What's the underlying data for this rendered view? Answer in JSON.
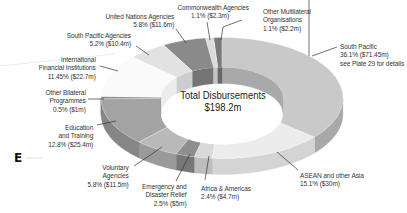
{
  "chart_data": {
    "type": "pie",
    "variant": "3d-donut",
    "title": "Total Disbursements",
    "total": "$198.2m",
    "total_value_m": 198.2,
    "start_angle_deg": 0,
    "direction": "clockwise",
    "slices": [
      {
        "name": "South Pacific",
        "pct": 36.1,
        "value_m": 71.45,
        "value_label": "$71.45m",
        "note": "see Plate 29 for details",
        "color": "#c9c9c9",
        "side": "#a9a9a9",
        "explode": 0
      },
      {
        "name": "ASEAN and other Asia",
        "pct": 15.1,
        "value_m": 30,
        "value_label": "$30m",
        "color": "#ececec",
        "side": "#d4d4d4",
        "explode": 0
      },
      {
        "name": "Africa & Americas",
        "pct": 2.4,
        "value_m": 4.7,
        "value_label": "$4.7m",
        "color": "#d9d9d9",
        "side": "#bdbdbd",
        "explode": 0
      },
      {
        "name": "Emergency and Disaster Relief",
        "pct": 2.5,
        "value_m": 5,
        "value_label": "$5m",
        "color": "#8f8f8f",
        "side": "#777777",
        "explode": 0
      },
      {
        "name": "Voluntary Agencies",
        "pct": 5.8,
        "value_m": 11.5,
        "value_label": "$11.5m",
        "color": "#b9b9b9",
        "side": "#9a9a9a",
        "explode": 0
      },
      {
        "name": "Education and Training",
        "pct": 12.8,
        "value_m": 25.4,
        "value_label": "$25.4m",
        "color": "#a3a3a3",
        "side": "#868686",
        "explode": 0
      },
      {
        "name": "Other Bilateral Programmes",
        "pct": 0.5,
        "value_m": 1,
        "value_label": "$1m",
        "color": "#7d7d7d",
        "side": "#666666",
        "explode": 0
      },
      {
        "name": "International Financial Institutions",
        "pct": 11.45,
        "value_m": 22.7,
        "value_label": "$22.7m",
        "color": "#fafafa",
        "side": "#ececec",
        "explode": 0
      },
      {
        "name": "South Pacific Agencies",
        "pct": 5.2,
        "value_m": 10.4,
        "value_label": "$10.4m",
        "color": "#e2e2e2",
        "side": "#cdcdcd",
        "explode": 0
      },
      {
        "name": "United Nations Agencies",
        "pct": 5.8,
        "value_m": 11.6,
        "value_label": "$11.6m",
        "color": "#8a8a8a",
        "side": "#747474",
        "explode": 0
      },
      {
        "name": "Commonwealth Agencies",
        "pct": 1.1,
        "value_m": 2.3,
        "value_label": "$2.3m",
        "color": "#dcdcdc",
        "side": "#c4c4c4",
        "explode": 0
      },
      {
        "name": "Other Multilateral Organisations",
        "pct": 1.1,
        "value_m": 2.2,
        "value_label": "$2.2m",
        "color": "#7a7a7a",
        "side": "#666666",
        "explode": 0
      }
    ],
    "legend": "none (direct labels with leader lines)"
  },
  "center": {
    "line1": "Total Disbursements",
    "line2": "$198.2m"
  },
  "marker": "E",
  "labels": {
    "south_pacific": [
      "South Pacific",
      "36.1% ($71.45m)",
      "see Plate 29 for details"
    ],
    "asean": [
      "ASEAN and other Asia",
      "15.1% ($30m)"
    ],
    "africa": [
      "Africa & Americas",
      "2.4% ($4.7m)"
    ],
    "emergency": [
      "Emergency and",
      "Disaster Relief",
      "2.5% ($5m)"
    ],
    "voluntary": [
      "Voluntary",
      "Agencies",
      "5.8% ($11.5m)"
    ],
    "education": [
      "Education",
      "and Training",
      "12.8% ($25.4m)"
    ],
    "other_bilateral": [
      "Other Bilateral",
      "Programmes",
      "0.5% ($1m)"
    ],
    "ifi": [
      "International",
      "Financial Institutions",
      "11.45% ($22.7m)"
    ],
    "spa": [
      "South Pacific Agencies",
      "5.2% ($10.4m)"
    ],
    "un": [
      "United Nations Agencies",
      "5.8% ($11.6m)"
    ],
    "commonwealth": [
      "Commonwealth Agencies",
      "1.1% ($2.3m)"
    ],
    "other_multilateral": [
      "Other Multilateral",
      "Organisations",
      "1.1% ($2.2m)"
    ]
  }
}
